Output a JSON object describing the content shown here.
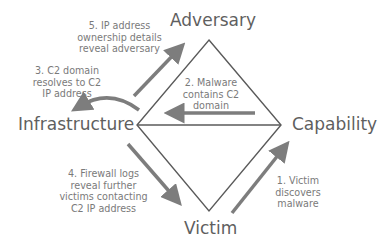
{
  "nodes": {
    "adversary": "Adversary",
    "infrastructure": "Infrastructure",
    "capability": "Capability",
    "victim": "Victim"
  },
  "steps": {
    "step1": [
      "1. Victim",
      "discovers",
      "malware"
    ],
    "step2": [
      "2. Malware",
      "contains C2",
      "domain"
    ],
    "step3": [
      "3. C2 domain",
      "resolves to C2",
      "IP address"
    ],
    "step4": [
      "4. Firewall logs",
      "reveal further",
      "victims contacting",
      "C2 IP address"
    ],
    "step5": [
      "5. IP address",
      "ownership details",
      "reveal adversary"
    ]
  },
  "colors": {
    "line": "#5a5a5a",
    "arrow": "#7d7d7d",
    "node_text": "#5f5f5f",
    "note_text": "#7a7a7a"
  }
}
